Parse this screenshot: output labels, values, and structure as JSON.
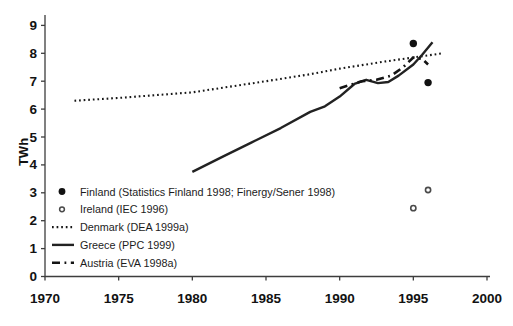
{
  "chart_data": {
    "type": "line",
    "title": "",
    "xlabel": "",
    "ylabel": "TWh",
    "xlim": [
      1970,
      2000
    ],
    "ylim": [
      0,
      9
    ],
    "x_ticks": [
      1970,
      1975,
      1980,
      1985,
      1990,
      1995,
      2000
    ],
    "y_ticks": [
      0,
      1,
      2,
      3,
      4,
      5,
      6,
      7,
      8,
      9
    ],
    "grid": false,
    "legend_position": "inside-lower-left",
    "series": [
      {
        "name": "Finland",
        "label": "Finland (Statistics Finland 1998; Finergy/Sener 1998)",
        "style": "scatter-filled",
        "color": "#111111",
        "points": [
          [
            1995,
            8.35
          ],
          [
            1996,
            6.95
          ]
        ]
      },
      {
        "name": "Ireland",
        "label": "Ireland (IEC 1996)",
        "style": "scatter-open",
        "color": "#4a4a4a",
        "points": [
          [
            1995,
            2.45
          ],
          [
            1996,
            3.1
          ]
        ]
      },
      {
        "name": "Denmark",
        "label": "Denmark (DEA 1999a)",
        "style": "dotted",
        "color": "#161616",
        "points": [
          [
            1972,
            6.3
          ],
          [
            1975,
            6.4
          ],
          [
            1980,
            6.6
          ],
          [
            1985,
            7.0
          ],
          [
            1988,
            7.25
          ],
          [
            1990,
            7.45
          ],
          [
            1993,
            7.7
          ],
          [
            1995,
            7.85
          ],
          [
            1997,
            8.0
          ]
        ]
      },
      {
        "name": "Greece",
        "label": "Greece (PPC 1999)",
        "style": "solid",
        "color": "#222222",
        "points": [
          [
            1980,
            3.75
          ],
          [
            1982,
            4.28
          ],
          [
            1984,
            4.8
          ],
          [
            1986,
            5.32
          ],
          [
            1988,
            5.9
          ],
          [
            1989,
            6.1
          ],
          [
            1990,
            6.45
          ],
          [
            1991,
            6.9
          ],
          [
            1991.8,
            7.05
          ],
          [
            1992.6,
            6.93
          ],
          [
            1993.3,
            6.97
          ],
          [
            1994,
            7.2
          ],
          [
            1995,
            7.6
          ],
          [
            1995.6,
            7.95
          ],
          [
            1996.3,
            8.4
          ]
        ]
      },
      {
        "name": "Austria",
        "label": "Austria (EVA 1998a)",
        "style": "dashed",
        "color": "#141414",
        "points": [
          [
            1990,
            6.75
          ],
          [
            1991.5,
            7.0
          ],
          [
            1992.5,
            7.05
          ],
          [
            1993.5,
            7.2
          ],
          [
            1994.3,
            7.5
          ],
          [
            1995,
            7.85
          ],
          [
            1995.6,
            7.8
          ],
          [
            1996,
            7.6
          ]
        ]
      }
    ]
  }
}
